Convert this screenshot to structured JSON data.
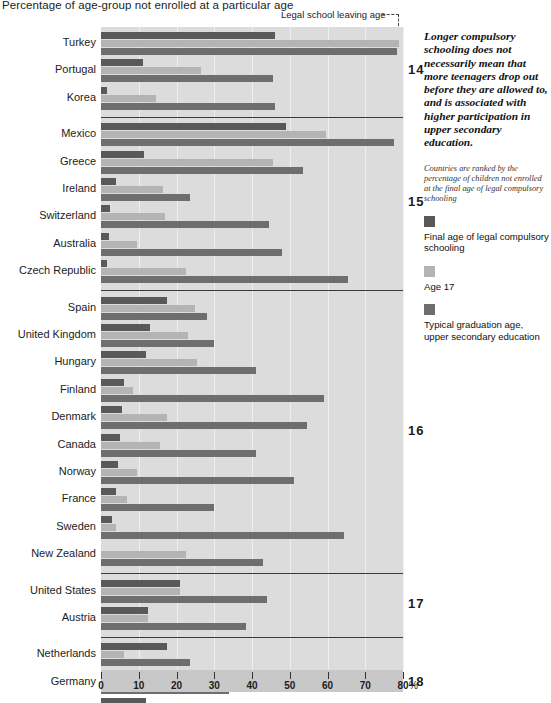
{
  "title": "Percentage of age-group not enrolled at a particular age",
  "axis": {
    "unit": "%",
    "ticks": [
      0,
      10,
      20,
      30,
      40,
      50,
      60,
      70,
      80
    ],
    "min": 0,
    "max": 80
  },
  "callout": {
    "leaving_age_label": "Legal school leaving age",
    "arrow_icon": "down-arrow-icon"
  },
  "sidebar": {
    "headline": "Longer compulsory schooling does not necessarily mean that more teenagers drop out before they are allowed to, and is associated with higher participation in upper secondary education.",
    "rank_note": "Countries are ranked by the percentage of children not enrolled at the final age of legal compulsory schooling",
    "legend": [
      {
        "label": "Final age of legal compulsory schooling",
        "color": "#595959"
      },
      {
        "label": "Age 17",
        "color": "#b4b4b4"
      },
      {
        "label": "Typical graduation age, upper secondary education",
        "color": "#6e6e6e"
      }
    ]
  },
  "chart_data": {
    "type": "bar",
    "orientation": "horizontal",
    "title": "Percentage of age-group not enrolled at a particular age",
    "xlabel": "%",
    "ylabel": "",
    "xlim": [
      0,
      80
    ],
    "grid": true,
    "legend_position": "right",
    "series": [
      {
        "name": "Final age of legal compulsory schooling",
        "color": "#595959"
      },
      {
        "name": "Age 17",
        "color": "#b4b4b4"
      },
      {
        "name": "Typical graduation age, upper secondary education",
        "color": "#6e6e6e"
      }
    ],
    "groups": [
      {
        "leaving_age": "14",
        "countries": [
          {
            "name": "Turkey",
            "values": [
              46.0,
              79.0,
              78.5
            ]
          },
          {
            "name": "Portugal",
            "values": [
              11.0,
              26.5,
              45.5
            ]
          },
          {
            "name": "Korea",
            "values": [
              1.5,
              14.5,
              46.0
            ]
          }
        ]
      },
      {
        "leaving_age": "15",
        "countries": [
          {
            "name": "Mexico",
            "values": [
              49.0,
              59.5,
              77.5
            ]
          },
          {
            "name": "Greece",
            "values": [
              11.5,
              45.5,
              53.5
            ]
          },
          {
            "name": "Ireland",
            "values": [
              4.0,
              16.5,
              23.5
            ]
          },
          {
            "name": "Switzerland",
            "values": [
              2.5,
              17.0,
              44.5
            ]
          },
          {
            "name": "Australia",
            "values": [
              2.0,
              9.5,
              48.0
            ]
          },
          {
            "name": "Czech Republic",
            "values": [
              1.5,
              22.5,
              65.5
            ]
          }
        ]
      },
      {
        "leaving_age": "16",
        "countries": [
          {
            "name": "Spain",
            "values": [
              17.5,
              25.0,
              28.0
            ]
          },
          {
            "name": "United Kingdom",
            "values": [
              13.0,
              23.0,
              30.0
            ]
          },
          {
            "name": "Hungary",
            "values": [
              12.0,
              25.5,
              41.0
            ]
          },
          {
            "name": "Finland",
            "values": [
              6.0,
              8.5,
              59.0
            ]
          },
          {
            "name": "Denmark",
            "values": [
              5.5,
              17.5,
              54.5
            ]
          },
          {
            "name": "Canada",
            "values": [
              5.0,
              15.5,
              41.0
            ]
          },
          {
            "name": "Norway",
            "values": [
              4.5,
              9.5,
              51.0
            ]
          },
          {
            "name": "France",
            "values": [
              4.0,
              7.0,
              30.0
            ]
          },
          {
            "name": "Sweden",
            "values": [
              3.0,
              4.0,
              64.5
            ]
          },
          {
            "name": "New Zealand",
            "values": [
              0.0,
              22.5,
              43.0
            ]
          }
        ]
      },
      {
        "leaving_age": "17",
        "countries": [
          {
            "name": "United States",
            "values": [
              21.0,
              21.0,
              44.0
            ]
          },
          {
            "name": "Austria",
            "values": [
              12.5,
              12.5,
              38.5
            ]
          }
        ]
      },
      {
        "leaving_age": "18",
        "countries": [
          {
            "name": "Netherlands",
            "values": [
              17.5,
              6.0,
              23.5
            ]
          },
          {
            "name": "Germany",
            "values": [
              15.5,
              6.0,
              34.0
            ]
          },
          {
            "name": "Belgium",
            "values": [
              12.0,
              0.0,
              23.0
            ]
          }
        ]
      }
    ]
  }
}
